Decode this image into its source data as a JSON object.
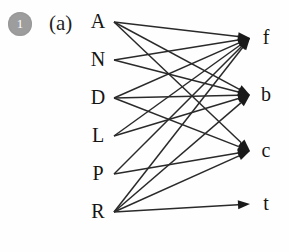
{
  "figure": {
    "badge_number": "1",
    "panel_label": "(a)",
    "type": "bipartite-directed-graph",
    "left_nodes": [
      {
        "id": "A",
        "label": "A",
        "x": 98,
        "y": 28
      },
      {
        "id": "N",
        "label": "N",
        "x": 98,
        "y": 66
      },
      {
        "id": "D",
        "label": "D",
        "x": 98,
        "y": 104
      },
      {
        "id": "L",
        "label": "L",
        "x": 98,
        "y": 142
      },
      {
        "id": "P",
        "label": "P",
        "x": 98,
        "y": 180
      },
      {
        "id": "R",
        "label": "R",
        "x": 98,
        "y": 218
      }
    ],
    "right_nodes": [
      {
        "id": "f",
        "label": "f",
        "x": 266,
        "y": 44
      },
      {
        "id": "b",
        "label": "b",
        "x": 266,
        "y": 101
      },
      {
        "id": "c",
        "label": "c",
        "x": 266,
        "y": 157
      },
      {
        "id": "t",
        "label": "t",
        "x": 266,
        "y": 210
      }
    ],
    "edges": [
      {
        "from": "A",
        "to": "f"
      },
      {
        "from": "A",
        "to": "b"
      },
      {
        "from": "A",
        "to": "c"
      },
      {
        "from": "N",
        "to": "f"
      },
      {
        "from": "N",
        "to": "b"
      },
      {
        "from": "D",
        "to": "f"
      },
      {
        "from": "D",
        "to": "b"
      },
      {
        "from": "D",
        "to": "c"
      },
      {
        "from": "L",
        "to": "f"
      },
      {
        "from": "L",
        "to": "b"
      },
      {
        "from": "P",
        "to": "f"
      },
      {
        "from": "P",
        "to": "c"
      },
      {
        "from": "R",
        "to": "f"
      },
      {
        "from": "R",
        "to": "b"
      },
      {
        "from": "R",
        "to": "c"
      },
      {
        "from": "R",
        "to": "t"
      }
    ],
    "colors": {
      "edge": "#2a2a2a",
      "arrow": "#1a1a1a",
      "text": "#151515",
      "badge_bg": "#9d9d9d",
      "badge_text": "#ffffff",
      "background": "#fefefe"
    },
    "geometry": {
      "edge_start_x": 114,
      "edge_end_x": 250,
      "arrow_length": 12,
      "arrow_half_width": 4.5
    }
  }
}
